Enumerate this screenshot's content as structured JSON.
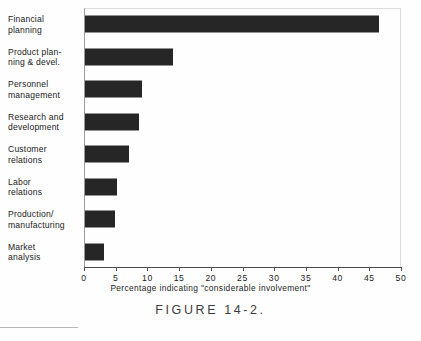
{
  "chart_data": {
    "type": "bar",
    "orientation": "horizontal",
    "title": "",
    "xlabel": "Percentage indicating \"considerable involvement\"",
    "ylabel": "",
    "xlim": [
      0,
      50
    ],
    "xticks": [
      0,
      5,
      10,
      15,
      20,
      25,
      30,
      35,
      40,
      45,
      50
    ],
    "xtick_labels": [
      "0",
      "5",
      "10",
      "15",
      "20",
      "25",
      "30",
      "35",
      "40",
      "45",
      "50"
    ],
    "grid": false,
    "legend": null,
    "bar_color": "#262626",
    "categories": [
      "Financial\nplanning",
      "Product plan-\nning & devel.",
      "Personnel\nmanagement",
      "Research and\ndevelopment",
      "Customer\nrelations",
      "Labor\nrelations",
      "Production/\nmanufacturing",
      "Market\nanalysis"
    ],
    "values": [
      46.5,
      14,
      9,
      8.5,
      7,
      5,
      4.7,
      3
    ]
  },
  "caption": {
    "text": "FIGURE  14-2."
  },
  "footer": {
    "note": ""
  }
}
